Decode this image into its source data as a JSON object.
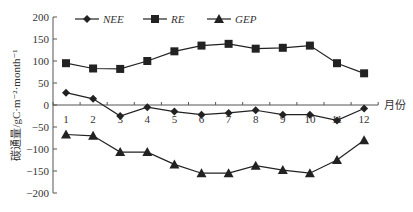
{
  "chart_data": {
    "type": "line",
    "title": "",
    "xlabel": "月份",
    "ylabel": "碳通量/gC·m⁻²·month⁻¹",
    "ylim": [
      -200,
      200
    ],
    "yticks": [
      200,
      150,
      100,
      50,
      0,
      -50,
      -100,
      -150,
      -200
    ],
    "categories": [
      "1",
      "2",
      "3",
      "4",
      "5",
      "6",
      "7",
      "8",
      "9",
      "10",
      "11",
      "12"
    ],
    "grid": false,
    "legend_position": "top",
    "series": [
      {
        "name": "NEE",
        "marker": "diamond",
        "values": [
          28,
          14,
          -25,
          -5,
          -15,
          -22,
          -18,
          -12,
          -22,
          -22,
          -35,
          -8
        ]
      },
      {
        "name": "RE",
        "marker": "square",
        "values": [
          95,
          83,
          82,
          100,
          122,
          135,
          139,
          128,
          130,
          135,
          95,
          72
        ]
      },
      {
        "name": "GEP",
        "marker": "triangle",
        "values": [
          -67,
          -70,
          -107,
          -107,
          -135,
          -155,
          -155,
          -138,
          -148,
          -155,
          -125,
          -80
        ]
      }
    ]
  },
  "colors": {
    "line": "#222222",
    "axis": "#555555",
    "text": "#333333"
  }
}
